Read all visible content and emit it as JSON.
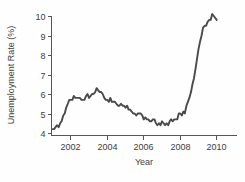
{
  "chart_data": {
    "type": "line",
    "title": "",
    "xlabel": "Year",
    "ylabel": "Unemployment Rate (%)",
    "xlim": [
      2001.0,
      2010.2
    ],
    "ylim": [
      4.0,
      10.3
    ],
    "xticks": [
      2002,
      2004,
      2006,
      2008,
      2010
    ],
    "xtick_labels": [
      "2002",
      "2004",
      "2006",
      "2008",
      "2010"
    ],
    "yticks": [
      4,
      5,
      6,
      7,
      8,
      9,
      10
    ],
    "ytick_labels": [
      "4",
      "5",
      "6",
      "7",
      "8",
      "9",
      "10"
    ],
    "grid": false,
    "legend": null,
    "line_color": "#4a4a4a",
    "series": [
      {
        "name": "Unemployment Rate",
        "x": [
          2001.05,
          2001.13,
          2001.21,
          2001.29,
          2001.38,
          2001.46,
          2001.54,
          2001.63,
          2001.71,
          2001.79,
          2001.88,
          2001.96,
          2002.04,
          2002.13,
          2002.21,
          2002.29,
          2002.38,
          2002.46,
          2002.54,
          2002.63,
          2002.71,
          2002.79,
          2002.88,
          2002.96,
          2003.04,
          2003.13,
          2003.21,
          2003.29,
          2003.38,
          2003.46,
          2003.54,
          2003.63,
          2003.71,
          2003.79,
          2003.88,
          2003.96,
          2004.04,
          2004.13,
          2004.21,
          2004.29,
          2004.38,
          2004.46,
          2004.54,
          2004.63,
          2004.71,
          2004.79,
          2004.88,
          2004.96,
          2005.04,
          2005.13,
          2005.21,
          2005.29,
          2005.38,
          2005.46,
          2005.54,
          2005.63,
          2005.71,
          2005.79,
          2005.88,
          2005.96,
          2006.04,
          2006.13,
          2006.21,
          2006.29,
          2006.38,
          2006.46,
          2006.54,
          2006.63,
          2006.71,
          2006.79,
          2006.88,
          2006.96,
          2007.04,
          2007.13,
          2007.21,
          2007.29,
          2007.38,
          2007.46,
          2007.54,
          2007.63,
          2007.71,
          2007.79,
          2007.88,
          2007.96,
          2008.04,
          2008.13,
          2008.21,
          2008.29,
          2008.38,
          2008.46,
          2008.54,
          2008.63,
          2008.71,
          2008.79,
          2008.88,
          2008.96,
          2009.04,
          2009.13,
          2009.21,
          2009.29,
          2009.38,
          2009.46,
          2009.54,
          2009.63,
          2009.71,
          2009.79,
          2009.88,
          2009.96,
          2010.04
        ],
        "y": [
          4.2,
          4.2,
          4.3,
          4.4,
          4.3,
          4.5,
          4.6,
          4.9,
          5.0,
          5.3,
          5.5,
          5.7,
          5.7,
          5.7,
          5.9,
          5.8,
          5.8,
          5.8,
          5.8,
          5.7,
          5.7,
          5.7,
          5.9,
          6.0,
          5.8,
          5.9,
          6.0,
          6.0,
          6.1,
          6.3,
          6.2,
          6.1,
          6.1,
          6.0,
          5.8,
          5.7,
          5.7,
          5.6,
          5.8,
          5.6,
          5.6,
          5.6,
          5.5,
          5.4,
          5.4,
          5.5,
          5.4,
          5.4,
          5.3,
          5.4,
          5.2,
          5.2,
          5.1,
          5.0,
          5.0,
          4.9,
          5.0,
          5.0,
          5.0,
          4.9,
          4.7,
          4.8,
          4.7,
          4.7,
          4.6,
          4.6,
          4.7,
          4.7,
          4.5,
          4.4,
          4.5,
          4.4,
          4.6,
          4.5,
          4.4,
          4.5,
          4.4,
          4.6,
          4.7,
          4.6,
          4.7,
          4.7,
          4.7,
          5.0,
          5.0,
          4.9,
          5.1,
          5.0,
          5.4,
          5.6,
          5.8,
          6.1,
          6.5,
          6.8,
          7.3,
          7.8,
          8.3,
          8.7,
          9.0,
          9.4,
          9.5,
          9.5,
          9.7,
          9.8,
          9.8,
          10.1,
          10.0,
          9.9,
          9.8
        ]
      }
    ]
  },
  "axes": {
    "ylabel_text": "Unemployment Rate (%)",
    "xlabel_text": "Year"
  }
}
